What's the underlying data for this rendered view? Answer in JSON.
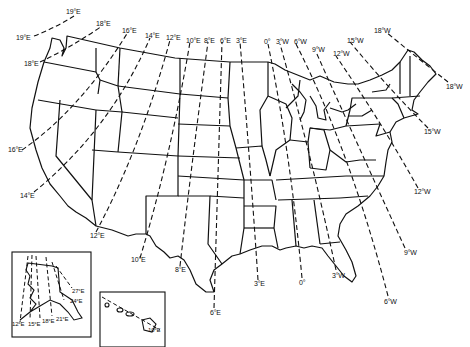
{
  "map": {
    "title": "Isogonic lines of magnetic declination, United States",
    "contiguous_us_labels": [
      {
        "text": "19°E",
        "x": 71,
        "y": 12
      },
      {
        "text": "19°E",
        "x": 20,
        "y": 34
      },
      {
        "text": "18°E",
        "x": 99,
        "y": 21
      },
      {
        "text": "18°E",
        "x": 26,
        "y": 61
      },
      {
        "text": "16°E",
        "x": 124,
        "y": 28
      },
      {
        "text": "16°E",
        "x": 9,
        "y": 148
      },
      {
        "text": "14°E",
        "x": 147,
        "y": 34
      },
      {
        "text": "14°E",
        "x": 20,
        "y": 193
      },
      {
        "text": "12°E",
        "x": 166,
        "y": 36
      },
      {
        "text": "12°E",
        "x": 91,
        "y": 234
      },
      {
        "text": "10°E",
        "x": 186,
        "y": 39
      },
      {
        "text": "10°E",
        "x": 132,
        "y": 258
      },
      {
        "text": "8°E",
        "x": 204,
        "y": 39
      },
      {
        "text": "8°E",
        "x": 176,
        "y": 268
      },
      {
        "text": "6°E",
        "x": 220,
        "y": 39
      },
      {
        "text": "6°E",
        "x": 211,
        "y": 310
      },
      {
        "text": "3°E",
        "x": 236,
        "y": 39
      },
      {
        "text": "3°E",
        "x": 254,
        "y": 281
      },
      {
        "text": "0°",
        "x": 264,
        "y": 40
      },
      {
        "text": "0°",
        "x": 299,
        "y": 280
      },
      {
        "text": "3°W",
        "x": 276,
        "y": 40
      },
      {
        "text": "3°W",
        "x": 333,
        "y": 273
      },
      {
        "text": "6°W",
        "x": 294,
        "y": 40
      },
      {
        "text": "6°W",
        "x": 385,
        "y": 299
      },
      {
        "text": "9°W",
        "x": 313,
        "y": 48
      },
      {
        "text": "9°W",
        "x": 405,
        "y": 250
      },
      {
        "text": "12°W",
        "x": 333,
        "y": 52
      },
      {
        "text": "12°W",
        "x": 415,
        "y": 190
      },
      {
        "text": "15°W",
        "x": 348,
        "y": 38
      },
      {
        "text": "15°W",
        "x": 425,
        "y": 129
      },
      {
        "text": "18°W",
        "x": 375,
        "y": 28
      },
      {
        "text": "18°W",
        "x": 448,
        "y": 84
      }
    ],
    "insets": [
      {
        "name": "Alaska",
        "labels": [
          {
            "text": "27°E",
            "x": 72,
            "y": 290
          },
          {
            "text": "24°E",
            "x": 69,
            "y": 300
          },
          {
            "text": "21°E",
            "x": 56,
            "y": 318
          },
          {
            "text": "18°E",
            "x": 42,
            "y": 320
          },
          {
            "text": "15°E",
            "x": 28,
            "y": 322
          },
          {
            "text": "12°E",
            "x": 12,
            "y": 322
          }
        ]
      },
      {
        "name": "Hawaii",
        "labels": [
          {
            "text": "10°E",
            "x": 148,
            "y": 328
          }
        ]
      }
    ]
  }
}
